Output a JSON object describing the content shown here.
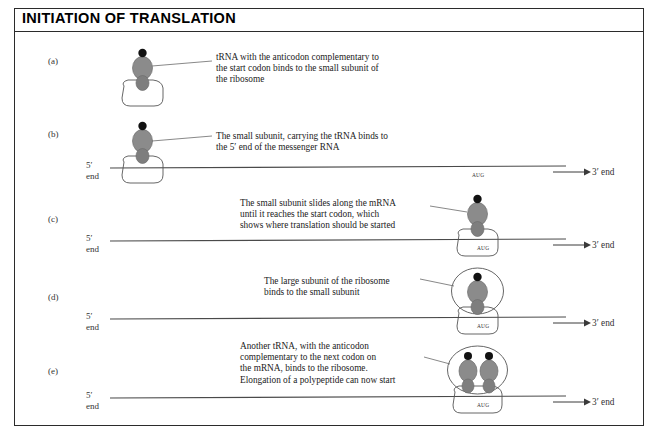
{
  "figure": {
    "title": "INITIATION OF TRANSLATION",
    "panels": [
      {
        "label": "(a)",
        "caption": "tRNA with the anticodon complementary to\nthe start codon binds to the small subunit of\nthe ribosome",
        "has_mrna": false,
        "end5": "",
        "end5_second": "",
        "end3": "",
        "codon": ""
      },
      {
        "label": "(b)",
        "caption": "The small subunit, carrying the tRNA binds to\nthe 5′ end of the messenger RNA",
        "has_mrna": true,
        "end5": "5′",
        "end5_second": "end",
        "end3": "3′ end",
        "codon": "AUG"
      },
      {
        "label": "(c)",
        "caption": "The small subunit slides along the mRNA\nuntil it reaches the start codon, which\nshows where translation should be started",
        "has_mrna": true,
        "end5": "5′",
        "end5_second": "end",
        "end3": "3′ end",
        "codon": "AUG"
      },
      {
        "label": "(d)",
        "caption": "The large subunit of the ribosome\nbinds to the small subunit",
        "has_mrna": true,
        "end5": "5′",
        "end5_second": "end",
        "end3": "3′ end",
        "codon": "AUG"
      },
      {
        "label": "(e)",
        "caption": "Another tRNA, with the anticodon\ncomplementary to the next codon on\nthe mRNA, binds to the ribosome.\nElongation of a polypeptide can now start",
        "has_mrna": true,
        "end5": "5′",
        "end5_second": "end",
        "end3": "3′ end",
        "codon": "AUG"
      }
    ],
    "icons": {
      "trna": "trna-icon",
      "amino_acid": "amino-acid-dot-icon",
      "small_subunit": "small-ribosomal-subunit-icon",
      "large_subunit": "large-ribosomal-subunit-icon",
      "mrna_strand": "mrna-strand-icon",
      "direction_arrow": "direction-arrow-icon",
      "leader_line": "leader-line-icon"
    },
    "colors": {
      "trna_fill": "#8b8b8b",
      "amino_acid_fill": "#111111",
      "outline": "#555555",
      "mrna_stroke": "#4a4a4a",
      "text": "#222222",
      "frame": "#2b2b2b"
    }
  }
}
